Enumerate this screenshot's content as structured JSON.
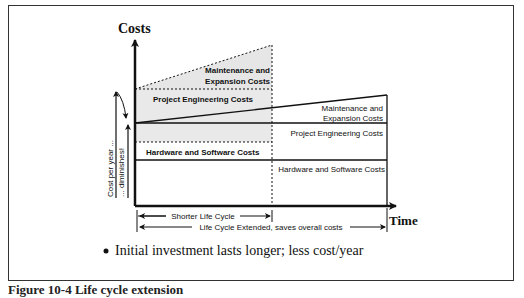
{
  "diagram": {
    "y_axis_label": "Costs",
    "x_axis_label": "Time",
    "left_labels": {
      "cost_per_year": "Cost per year ...",
      "diminishes": "... diminishes!"
    },
    "short_cycle": {
      "maintenance_line1": "Maintenance and",
      "maintenance_line2": "Expansion Costs",
      "engineering": "Project Engineering Costs",
      "hardware": "Hardware and Software Costs"
    },
    "extended_cycle": {
      "maintenance_line1": "Maintenance and",
      "maintenance_line2": "Expansion Costs",
      "engineering": "Project Engineering Costs",
      "hardware": "Hardware and Software Costs"
    },
    "spans": {
      "shorter": "Shorter Life Cycle",
      "extended": "Life Cycle Extended, saves overall costs"
    },
    "bullet": "Initial investment lasts longer; less cost/year",
    "colors": {
      "line": "#111111",
      "shade": "#e6e6e6"
    }
  },
  "caption": "Figure 10-4 Life cycle extension"
}
